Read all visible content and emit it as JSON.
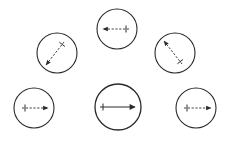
{
  "diagram": {
    "colors": {
      "stroke": "#2a2a2a",
      "background": "#ffffff"
    },
    "circles": [
      {
        "id": "top",
        "cx": 117,
        "cy": 29,
        "r": 20,
        "arrow": {
          "x1": 129,
          "y1": 29,
          "x2": 103,
          "y2": 29,
          "style": "dashed",
          "tick_at": "start"
        }
      },
      {
        "id": "upper-left",
        "cx": 57,
        "cy": 53,
        "r": 20,
        "arrow": {
          "x1": 64,
          "y1": 42,
          "x2": 46,
          "y2": 65,
          "style": "dashed",
          "tick_at": "start"
        }
      },
      {
        "id": "upper-right",
        "cx": 175,
        "cy": 53,
        "r": 20,
        "arrow": {
          "x1": 182,
          "y1": 64,
          "x2": 164,
          "y2": 41,
          "style": "dashed",
          "tick_at": "start"
        }
      },
      {
        "id": "lower-left",
        "cx": 34,
        "cy": 108,
        "r": 20,
        "arrow": {
          "x1": 22,
          "y1": 108,
          "x2": 48,
          "y2": 108,
          "style": "dashed",
          "tick_at": "start"
        }
      },
      {
        "id": "lower-center",
        "cx": 118,
        "cy": 107,
        "r": 23,
        "arrow": {
          "x1": 100,
          "y1": 107,
          "x2": 135,
          "y2": 107,
          "style": "solid",
          "tick_at": "start"
        }
      },
      {
        "id": "lower-right",
        "cx": 196,
        "cy": 108,
        "r": 20,
        "arrow": {
          "x1": 184,
          "y1": 108,
          "x2": 211,
          "y2": 108,
          "style": "dashed",
          "tick_at": "start"
        }
      }
    ]
  }
}
